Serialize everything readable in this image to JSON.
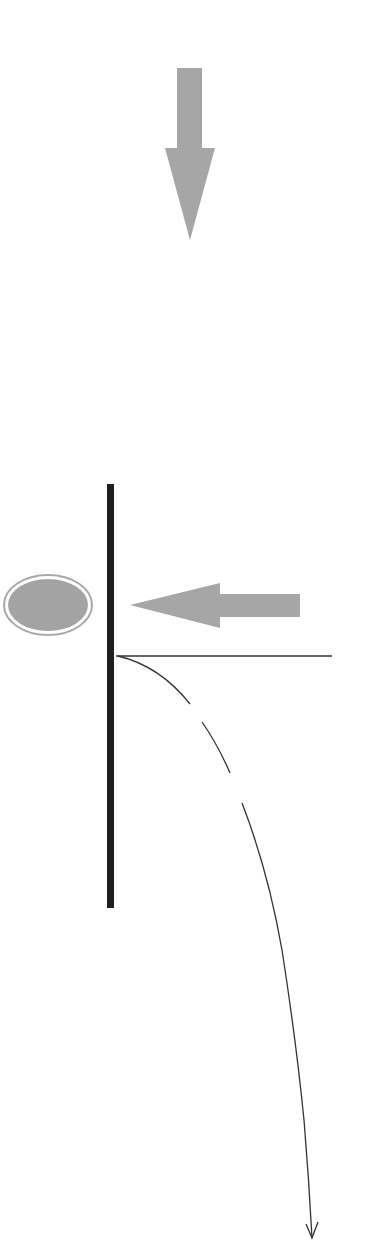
{
  "diagram": {
    "width": 392,
    "height": 1259,
    "colors": {
      "background": "#ffffff",
      "arrow_fill": "#a6a6a6",
      "ellipse_fill": "#a3a3a3",
      "ellipse_ring": "#a8a8a8",
      "wall": "#1f1f1f",
      "line": "#333333"
    },
    "elements": [
      {
        "id": "incoming-down-arrow",
        "kind": "block-arrow",
        "direction": "down"
      },
      {
        "id": "wall",
        "kind": "vertical-bar"
      },
      {
        "id": "particle",
        "kind": "ellipse"
      },
      {
        "id": "incoming-left-arrow",
        "kind": "block-arrow",
        "direction": "left"
      },
      {
        "id": "reference-line",
        "kind": "horizontal-line"
      },
      {
        "id": "deflected-trajectory",
        "kind": "curved-arrow",
        "style": "partially-dashed",
        "direction": "down"
      }
    ]
  }
}
